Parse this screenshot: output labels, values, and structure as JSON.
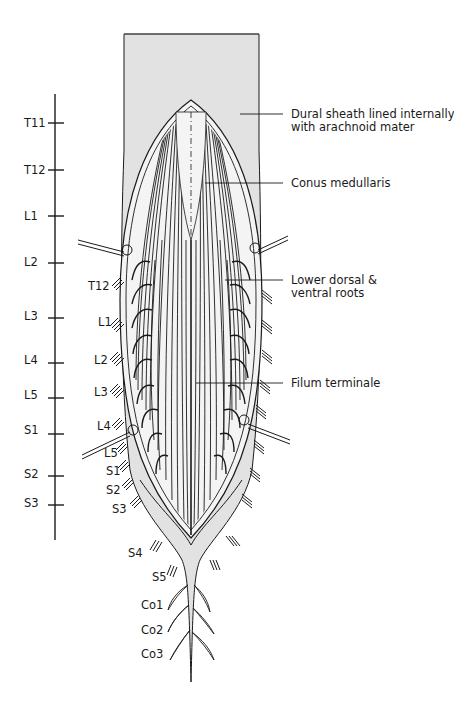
{
  "figure": {
    "type": "anatomical-diagram",
    "colors": {
      "dura_fill": "#e2e2e2",
      "inner_fill": "#f2f2f2",
      "line": "#1a1a1a",
      "background": "#ffffff"
    }
  },
  "vertebral_scale": {
    "labels": [
      "T11",
      "T12",
      "L1",
      "L2",
      "L3",
      "L4",
      "L5",
      "S1",
      "S2",
      "S3"
    ]
  },
  "nerve_root_labels": {
    "left": [
      "T12",
      "L1",
      "L2",
      "L3",
      "L4",
      "L5",
      "S1",
      "S2",
      "S3",
      "S4",
      "S5"
    ],
    "coccygeal": [
      "Co1",
      "Co2",
      "Co3"
    ]
  },
  "callouts": [
    {
      "id": "dura",
      "line1": "Dural sheath lined internally",
      "line2": "with arachnoid mater"
    },
    {
      "id": "conus",
      "line1": "Conus medullaris",
      "line2": ""
    },
    {
      "id": "roots",
      "line1": "Lower dorsal &",
      "line2": "ventral roots"
    },
    {
      "id": "filum",
      "line1": "Filum terminale",
      "line2": ""
    }
  ]
}
